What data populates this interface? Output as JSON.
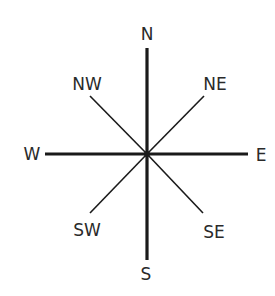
{
  "diagram": {
    "type": "compass-rose",
    "center": {
      "x": 147,
      "y": 154
    },
    "colors": {
      "stroke": "#1a1a1a",
      "label": "#2a2a2a",
      "background": "#ffffff"
    },
    "directions": {
      "n": {
        "label": "N"
      },
      "ne": {
        "label": "NE"
      },
      "e": {
        "label": "E"
      },
      "se": {
        "label": "SE"
      },
      "s": {
        "label": "S"
      },
      "sw": {
        "label": "SW"
      },
      "w": {
        "label": "W"
      },
      "nw": {
        "label": "NW"
      }
    },
    "cardinal_line_weight": "thick",
    "intercardinal_line_weight": "thin"
  }
}
